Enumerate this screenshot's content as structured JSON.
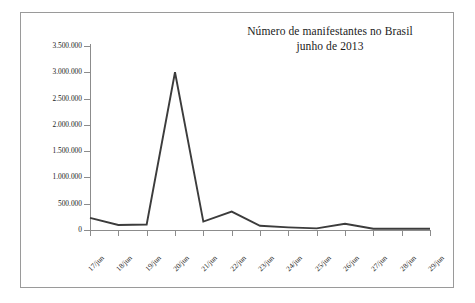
{
  "chart_data": {
    "type": "line",
    "title": "Número de manifestantes no Brasil",
    "subtitle": "junho de 2013",
    "title_lines": [
      "Número de manifestantes no Brasil",
      "junho de 2013"
    ],
    "xlabel": "",
    "ylabel": "",
    "categories": [
      "17/jun",
      "18/jun",
      "19/jun",
      "20/jun",
      "21/jun",
      "22/jun",
      "23/jun",
      "24/jun",
      "25/jun",
      "26/jun",
      "27/jun",
      "28/jun",
      "29/jun"
    ],
    "values": [
      230000,
      95000,
      105000,
      3000000,
      160000,
      350000,
      80000,
      50000,
      30000,
      120000,
      25000,
      25000,
      25000
    ],
    "ylim": [
      0,
      3500000
    ],
    "ytick_values": [
      0,
      500000,
      1000000,
      1500000,
      2000000,
      2500000,
      3000000,
      3500000
    ],
    "ytick_labels": [
      "0",
      "500.000",
      "1.000.000",
      "1.500.000",
      "2.000.000",
      "2.500.000",
      "3.000.000",
      "3.500.000"
    ],
    "grid": false,
    "legend": null,
    "legend_position": "none",
    "series_color": "#3c3c3c",
    "axis_color": "#8c8c8c",
    "frame_color": "#9a9a9a",
    "background": "#ffffff"
  }
}
